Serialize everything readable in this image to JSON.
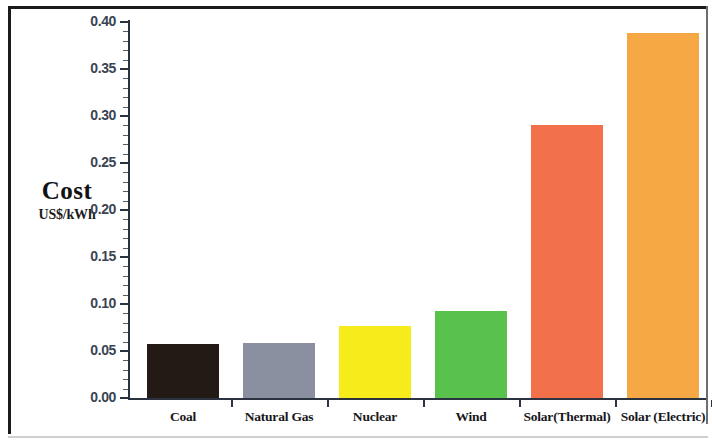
{
  "chart_data": {
    "type": "bar",
    "title": "",
    "xlabel": "",
    "ylabel": "Cost",
    "ylabel_unit": "US$/kWh",
    "ylim": [
      0.0,
      0.4
    ],
    "ytick_labels": [
      "0.40",
      "0.35",
      "0.30",
      "0.25",
      "0.20",
      "0.15",
      "0.10",
      "0.05",
      "0.00"
    ],
    "ytick_values": [
      0.4,
      0.35,
      0.3,
      0.25,
      0.2,
      0.15,
      0.1,
      0.05,
      0.0
    ],
    "minor_ticks_per_interval": 5,
    "grid": false,
    "legend": "none",
    "categories": [
      "Coal",
      "Natural Gas",
      "Nuclear",
      "Wind",
      "Solar(Thermal)",
      "Solar (Electric)"
    ],
    "values": [
      0.057,
      0.058,
      0.077,
      0.093,
      0.29,
      0.388
    ],
    "bar_colors": [
      "#231a16",
      "#8a909f",
      "#f7ec1b",
      "#59c24c",
      "#f3714a",
      "#f5a843"
    ],
    "bars": [
      {
        "category": "Coal",
        "value": 0.057,
        "color": "#231a16"
      },
      {
        "category": "Natural Gas",
        "value": 0.058,
        "color": "#8a909f"
      },
      {
        "category": "Nuclear",
        "value": 0.077,
        "color": "#f7ec1b"
      },
      {
        "category": "Wind",
        "value": 0.093,
        "color": "#59c24c"
      },
      {
        "category": "Solar(Thermal)",
        "value": 0.29,
        "color": "#f3714a"
      },
      {
        "category": "Solar (Electric)",
        "value": 0.388,
        "color": "#f5a843"
      }
    ],
    "axis_color": "#2c3340",
    "tick_label_color": "#3b4453",
    "background": "#ffffff"
  }
}
